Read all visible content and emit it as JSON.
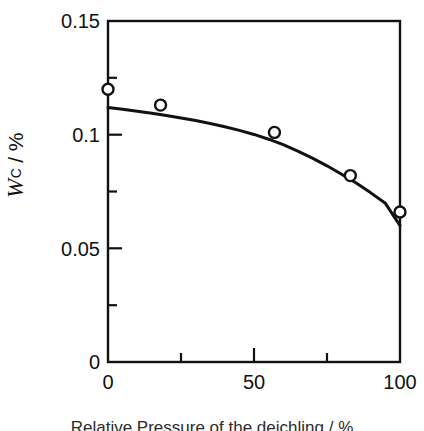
{
  "figure": {
    "background": "#ffffff",
    "ink_color": "#111111"
  },
  "axis_labels": {
    "y_symbol": "W",
    "y_subscript": "C",
    "y_separator": "/",
    "y_unit": "%",
    "y_full": "WC / %"
  },
  "caption": {
    "text": "Relative Pressure of the deichling / %",
    "visible": "partially-clipped"
  },
  "ticks": {
    "y_major_labels": [
      "0.15",
      "0.1",
      "0.05",
      "0"
    ],
    "y_major_values": [
      0.15,
      0.1,
      0.05,
      0
    ],
    "y_minor_values": [
      0.125,
      0.075,
      0.025
    ],
    "x_major_labels": [
      "0",
      "50",
      "100"
    ],
    "x_major_values": [
      0,
      50,
      100
    ],
    "x_minor_values": [
      25,
      75
    ]
  },
  "chart_data": {
    "type": "scatter",
    "title": "",
    "subtitle": "",
    "xlabel": "",
    "ylabel": "WC / %",
    "xlim": [
      0,
      100
    ],
    "ylim": [
      0,
      0.15
    ],
    "grid": false,
    "legend": null,
    "series": [
      {
        "name": "measured",
        "type": "scatter",
        "marker": "open-circle",
        "marker_size": 11,
        "x": [
          0,
          18,
          57,
          83,
          100
        ],
        "y": [
          0.12,
          0.113,
          0.101,
          0.082,
          0.066
        ]
      },
      {
        "name": "fitted curve",
        "type": "line",
        "line_width": 3,
        "x": [
          0,
          5,
          10,
          15,
          20,
          25,
          30,
          35,
          40,
          45,
          50,
          55,
          60,
          65,
          70,
          75,
          80,
          85,
          90,
          95,
          100
        ],
        "y": [
          0.112,
          0.1112,
          0.1103,
          0.1094,
          0.1084,
          0.1073,
          0.1062,
          0.1049,
          0.1035,
          0.1019,
          0.1001,
          0.098,
          0.0956,
          0.0928,
          0.0897,
          0.0863,
          0.0826,
          0.0787,
          0.0744,
          0.0698,
          0.06
        ]
      }
    ]
  },
  "geometry": {
    "plot_left_px": 108,
    "plot_right_px": 400,
    "plot_top_px": 21,
    "plot_bottom_px": 362
  }
}
